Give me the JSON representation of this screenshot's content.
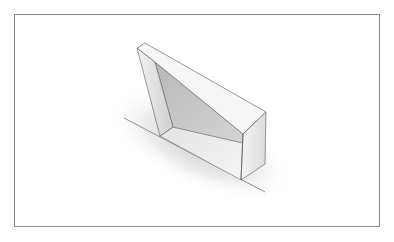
{
  "scene": {
    "description": "3D rendering of a wedge-shaped solid with a recessed sloped face, resting on a ground line",
    "colors": {
      "background": "#ffffff",
      "frame_border": "#8a8a8a",
      "top_face": "#f4f4f4",
      "left_column_face": "#d9d9d9",
      "recessed_face": "#c4c4c4",
      "floor_face": "#ececec",
      "right_face": "#e6e6e6",
      "edge": "#555555",
      "shadow": "#d0d0d0"
    }
  }
}
